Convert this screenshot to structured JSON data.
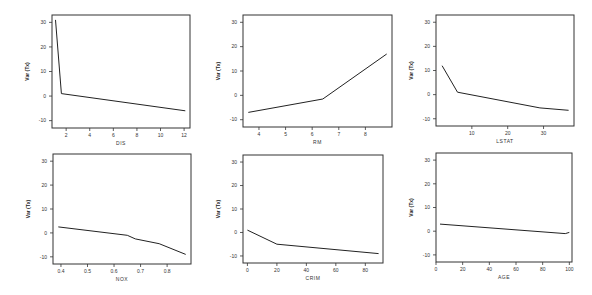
{
  "chart_data": [
    {
      "type": "line",
      "title": "",
      "xlabel": "DIS",
      "ylabel": "Var (Tx)",
      "xlim": [
        0.8,
        12.5
      ],
      "ylim": [
        -13,
        33
      ],
      "xticks": [
        2,
        4,
        6,
        8,
        10,
        12
      ],
      "yticks": [
        -10,
        0,
        10,
        20,
        30
      ],
      "grid": false,
      "x": [
        1.1,
        1.6,
        12.1
      ],
      "y": [
        31,
        1,
        -6
      ]
    },
    {
      "type": "line",
      "title": "",
      "xlabel": "RM",
      "ylabel": "Var (Tx)",
      "xlim": [
        3.4,
        9.0
      ],
      "ylim": [
        -13,
        33
      ],
      "xticks": [
        4,
        5,
        6,
        7,
        8
      ],
      "yticks": [
        -10,
        0,
        10,
        20,
        30
      ],
      "grid": false,
      "x": [
        3.6,
        6.4,
        8.8
      ],
      "y": [
        -7,
        -1.5,
        17
      ]
    },
    {
      "type": "line",
      "title": "",
      "xlabel": "LSTAT",
      "ylabel": "Var (Tx)",
      "xlim": [
        0,
        38.5
      ],
      "ylim": [
        -13,
        33
      ],
      "xticks": [
        10,
        20,
        30
      ],
      "yticks": [
        -10,
        0,
        10,
        20,
        30
      ],
      "grid": false,
      "x": [
        1.7,
        6,
        29,
        37
      ],
      "y": [
        12,
        1,
        -5.5,
        -6.5
      ]
    },
    {
      "type": "line",
      "title": "",
      "xlabel": "NOX",
      "ylabel": "Var (Tx)",
      "xlim": [
        0.37,
        0.89
      ],
      "ylim": [
        -13,
        33
      ],
      "xticks": [
        0.4,
        0.5,
        0.6,
        0.7,
        0.8
      ],
      "yticks": [
        -10,
        0,
        10,
        20,
        30
      ],
      "grid": false,
      "x": [
        0.39,
        0.65,
        0.68,
        0.77,
        0.87
      ],
      "y": [
        2.5,
        -1,
        -2.5,
        -4.5,
        -9
      ]
    },
    {
      "type": "line",
      "title": "",
      "xlabel": "CRIM",
      "ylabel": "Var (Tx)",
      "xlim": [
        -3,
        92
      ],
      "ylim": [
        -13,
        33
      ],
      "xticks": [
        0,
        20,
        40,
        60,
        80
      ],
      "yticks": [
        -10,
        0,
        10,
        20,
        30
      ],
      "grid": false,
      "x": [
        0,
        20,
        89
      ],
      "y": [
        1,
        -5,
        -9
      ]
    },
    {
      "type": "line",
      "title": "",
      "xlabel": "AGE",
      "ylabel": "Var (Tx)",
      "xlim": [
        0,
        102
      ],
      "ylim": [
        -13,
        33
      ],
      "xticks": [
        0,
        20,
        40,
        60,
        80,
        100
      ],
      "yticks": [
        -10,
        0,
        10,
        20,
        30
      ],
      "grid": false,
      "x": [
        3,
        97,
        100
      ],
      "y": [
        3,
        -1,
        -0.5
      ]
    }
  ],
  "panels": [
    {
      "xlabel": "DIS",
      "ylabel": "Var (Tx)"
    },
    {
      "xlabel": "RM",
      "ylabel": "Var (Tx)"
    },
    {
      "xlabel": "LSTAT",
      "ylabel": "Var (Tx)"
    },
    {
      "xlabel": "NOX",
      "ylabel": "Var (Tx)"
    },
    {
      "xlabel": "CRIM",
      "ylabel": "Var (Tx)"
    },
    {
      "xlabel": "AGE",
      "ylabel": "Var (Tx)"
    }
  ]
}
